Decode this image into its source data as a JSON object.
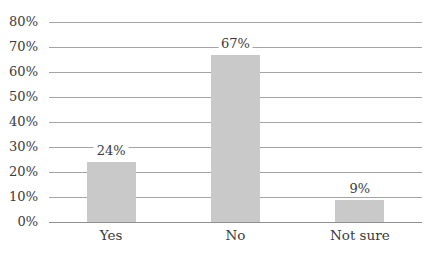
{
  "chart_data": {
    "type": "bar",
    "title": "",
    "xlabel": "",
    "ylabel": "",
    "categories": [
      "Yes",
      "No",
      "Not sure"
    ],
    "values": [
      24,
      67,
      9
    ],
    "data_labels": [
      "24%",
      "67%",
      "9%"
    ],
    "ylim": [
      0,
      80
    ],
    "ytick_step": 10,
    "ytick_labels": [
      "0%",
      "10%",
      "20%",
      "30%",
      "40%",
      "50%",
      "60%",
      "70%",
      "80%"
    ],
    "grid": true,
    "legend_position": "none",
    "colors": {
      "bar_fill": "#c9c9c9",
      "gridline": "#a4a4a4",
      "axis_line": "#8f8f8f",
      "text": "#3a3a3a",
      "background": "#ffffff"
    }
  }
}
